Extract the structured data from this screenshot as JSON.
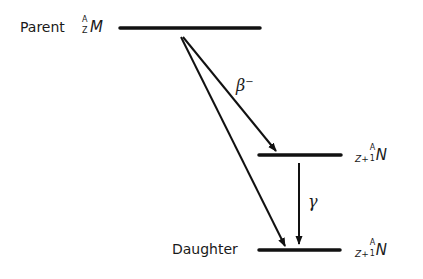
{
  "diagram": {
    "type": "beta-decay energy level diagram",
    "levels": [
      {
        "id": "parent",
        "label": "Parent",
        "nuclide": {
          "mass": "A",
          "atomic": "Z",
          "symbol": "M"
        }
      },
      {
        "id": "excited",
        "label": "",
        "nuclide": {
          "prefix": "Z+",
          "mass": "A",
          "atomic": "1",
          "symbol": "N"
        }
      },
      {
        "id": "daughter",
        "label": "Daughter",
        "nuclide": {
          "prefix": "Z+",
          "mass": "A",
          "atomic": "1",
          "symbol": "N"
        }
      }
    ],
    "transitions": [
      {
        "from": "parent",
        "to": "excited",
        "label": "β",
        "sup": "−"
      },
      {
        "from": "excited",
        "to": "daughter",
        "label": "γ"
      },
      {
        "from": "parent",
        "to": "daughter",
        "label": ""
      }
    ],
    "colors": {
      "line": "#111111",
      "background": "#ffffff"
    }
  }
}
